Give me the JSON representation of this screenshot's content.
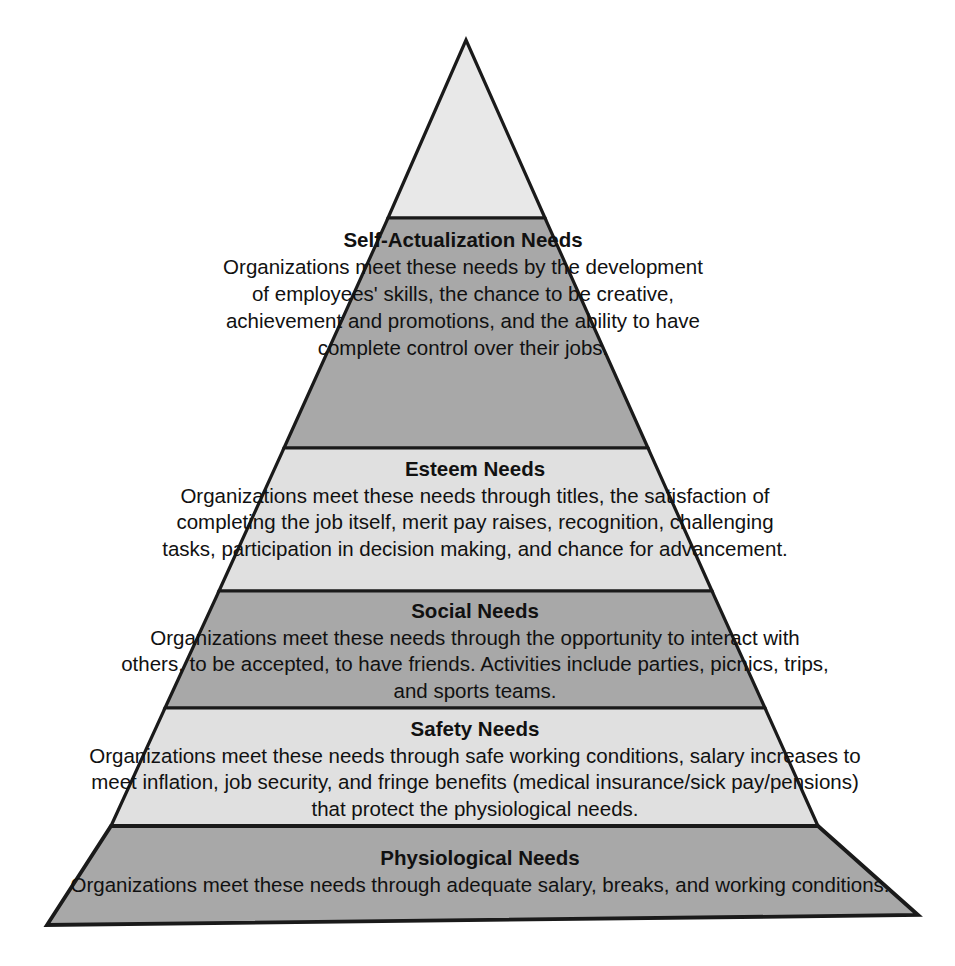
{
  "diagram": {
    "type": "pyramid",
    "name": "Maslow's Hierarchy of Needs in Organizations",
    "orientation": "apex-top",
    "tier_count": 5,
    "colors": {
      "fill_dark": "#a8a8a8",
      "fill_light": "#e0e0e0",
      "fill_apex": "#e8e8e8",
      "outline": "#1a1a1a",
      "text": "#111111",
      "background": "#ffffff"
    },
    "tiers": [
      {
        "id": "apex",
        "level": 0,
        "title": "",
        "description": "",
        "fill": "#e8e8e8",
        "has_text": false
      },
      {
        "id": "self-actualization",
        "level": 1,
        "title": "Self-Actualization Needs",
        "description": "Organizations meet these needs by the development of employees' skills, the chance to be creative, achievement and promotions, and the ability to have complete control over their jobs.",
        "fill": "#a8a8a8",
        "has_text": true
      },
      {
        "id": "esteem",
        "level": 2,
        "title": "Esteem Needs",
        "description": "Organizations meet these needs through titles, the satisfaction of completing the job itself, merit pay raises, recognition, challenging tasks, participation in decision making, and chance for advancement.",
        "fill": "#e0e0e0",
        "has_text": true
      },
      {
        "id": "social",
        "level": 3,
        "title": "Social Needs",
        "description": "Organizations meet these needs through the opportunity to interact with others, to be accepted, to have friends. Activities include parties, picnics, trips, and sports teams.",
        "fill": "#a8a8a8",
        "has_text": true
      },
      {
        "id": "safety",
        "level": 4,
        "title": "Safety Needs",
        "description": "Organizations meet these needs through safe working conditions, salary increases to meet inflation, job security, and fringe benefits (medical insurance/sick pay/pensions) that protect the physiological needs.",
        "fill": "#e0e0e0",
        "has_text": true
      },
      {
        "id": "physiological",
        "level": 5,
        "title": "Physiological Needs",
        "description": "Organizations meet these needs through adequate salary, breaks, and working conditions.",
        "fill": "#a8a8a8",
        "has_text": true
      }
    ]
  }
}
